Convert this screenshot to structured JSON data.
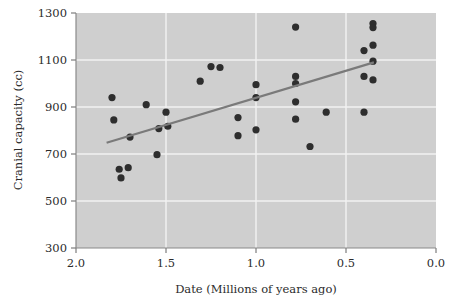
{
  "chart_data": {
    "type": "scatter",
    "title": "",
    "xlabel": "Date (Millions of years ago)",
    "ylabel": "Cranial capacity (cc)",
    "xlim": [
      2.0,
      0.0
    ],
    "ylim": [
      300,
      1300
    ],
    "x_reversed": true,
    "xticks": [
      "2.0",
      "1.5",
      "1.0",
      "0.5",
      "0.0"
    ],
    "xtick_values": [
      2.0,
      1.5,
      1.0,
      0.5,
      0.0
    ],
    "yticks": [
      "1300",
      "1100",
      "900",
      "700",
      "500",
      "300"
    ],
    "ytick_values": [
      1300,
      1100,
      900,
      700,
      500,
      300
    ],
    "grid": true,
    "grid_color": "#f2f2f2",
    "plot_background": "#cfcfcf",
    "point_color": "#2e2e2e",
    "line_color": "#7a7a7a",
    "legend": null,
    "points": [
      {
        "x": 1.8,
        "y": 940
      },
      {
        "x": 1.79,
        "y": 845
      },
      {
        "x": 1.76,
        "y": 635
      },
      {
        "x": 1.75,
        "y": 598
      },
      {
        "x": 1.71,
        "y": 642
      },
      {
        "x": 1.7,
        "y": 772
      },
      {
        "x": 1.61,
        "y": 910
      },
      {
        "x": 1.55,
        "y": 697
      },
      {
        "x": 1.54,
        "y": 808
      },
      {
        "x": 1.5,
        "y": 878
      },
      {
        "x": 1.49,
        "y": 818
      },
      {
        "x": 1.31,
        "y": 1010
      },
      {
        "x": 1.25,
        "y": 1072
      },
      {
        "x": 1.2,
        "y": 1068
      },
      {
        "x": 1.1,
        "y": 855
      },
      {
        "x": 1.1,
        "y": 778
      },
      {
        "x": 1.0,
        "y": 995
      },
      {
        "x": 1.0,
        "y": 940
      },
      {
        "x": 1.0,
        "y": 803
      },
      {
        "x": 0.78,
        "y": 1240
      },
      {
        "x": 0.78,
        "y": 1030
      },
      {
        "x": 0.78,
        "y": 1000
      },
      {
        "x": 0.78,
        "y": 922
      },
      {
        "x": 0.78,
        "y": 848
      },
      {
        "x": 0.7,
        "y": 732
      },
      {
        "x": 0.61,
        "y": 878
      },
      {
        "x": 0.4,
        "y": 1140
      },
      {
        "x": 0.4,
        "y": 1030
      },
      {
        "x": 0.4,
        "y": 878
      },
      {
        "x": 0.35,
        "y": 1255
      },
      {
        "x": 0.35,
        "y": 1238
      },
      {
        "x": 0.35,
        "y": 1163
      },
      {
        "x": 0.35,
        "y": 1095
      },
      {
        "x": 0.35,
        "y": 1015
      }
    ],
    "fit_line": {
      "x1": 1.83,
      "y1": 748,
      "x2": 0.345,
      "y2": 1090
    }
  }
}
